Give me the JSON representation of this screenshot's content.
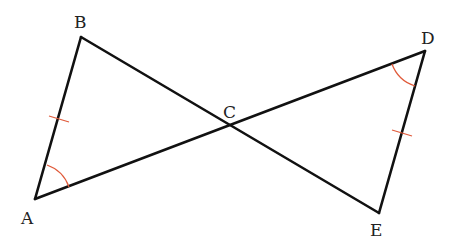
{
  "diagram": {
    "type": "geometry",
    "points": {
      "A": {
        "label": "A",
        "x": 35,
        "y": 199
      },
      "B": {
        "label": "B",
        "x": 81,
        "y": 37
      },
      "C": {
        "label": "C",
        "x": 230,
        "y": 125
      },
      "D": {
        "label": "D",
        "x": 425,
        "y": 51
      },
      "E": {
        "label": "E",
        "x": 379,
        "y": 213
      }
    },
    "segments": [
      "AB",
      "BE",
      "AD",
      "DE"
    ],
    "congruence_marks": {
      "tick_marks": [
        "AB",
        "DE"
      ],
      "angle_marks": [
        "angle BAC",
        "angle EDC"
      ]
    },
    "colors": {
      "lines": "#111111",
      "marks": "#e05a3a"
    }
  }
}
